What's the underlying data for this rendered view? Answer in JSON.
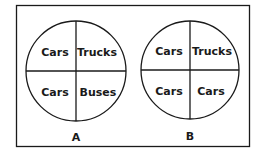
{
  "diagrams": [
    {
      "caption": "A",
      "quadrants": {
        "top_left": "Cars",
        "top_right": "Trucks",
        "bottom_left": "Cars",
        "bottom_right": "Buses"
      }
    },
    {
      "caption": "B",
      "quadrants": {
        "top_left": "Cars",
        "top_right": "Trucks",
        "bottom_left": "Cars",
        "bottom_right": "Cars"
      }
    }
  ],
  "colors": {
    "stroke": "#1a1a1a",
    "background": "#ffffff"
  }
}
